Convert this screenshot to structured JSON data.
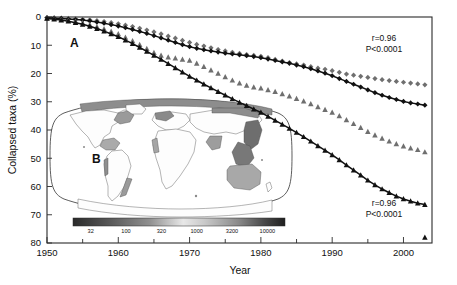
{
  "figure": {
    "panel_a_label": "A",
    "panel_b_label": "B"
  },
  "axes": {
    "xlabel": "Year",
    "ylabel": "Collapsed taxa (%)",
    "x_ticks": [
      "1950",
      "1960",
      "1970",
      "1980",
      "1990",
      "2000"
    ],
    "y_ticks": [
      "0",
      "10",
      "20",
      "30",
      "40",
      "50",
      "60",
      "70",
      "80"
    ]
  },
  "annotations": {
    "top": {
      "r": "r=0.96",
      "p": "P<0.0001"
    },
    "bottom": {
      "r": "r=0.96",
      "p": "P<0.0001"
    }
  },
  "colorbar": {
    "ticks": [
      "32",
      "100",
      "320",
      "1000",
      "3200",
      "10000"
    ]
  },
  "chart_data": {
    "type": "scatter",
    "title": "",
    "xlabel": "Year",
    "ylabel": "Collapsed taxa (%)",
    "xlim": [
      1950,
      2004
    ],
    "ylim": [
      80,
      0
    ],
    "y_inverted": true,
    "grid": false,
    "legend_position": "none",
    "x_ticks": [
      1950,
      1960,
      1970,
      1980,
      1990,
      2000
    ],
    "x_minor_ticks": [
      1955,
      1965,
      1975,
      1985,
      1995
    ],
    "y_ticks": [
      0,
      10,
      20,
      30,
      40,
      50,
      60,
      70,
      80
    ],
    "annotations": [
      {
        "text_r": "r=0.96",
        "text_p": "P<0.0001",
        "x": 1996,
        "y": 7
      },
      {
        "text_r": "r=0.96",
        "text_p": "P<0.0001",
        "x": 1996,
        "y": 64
      }
    ],
    "series": [
      {
        "name": "gray-diamonds",
        "marker": "diamond",
        "color": "#6f6f6f",
        "fit_line": false,
        "x": [
          1950,
          1951,
          1952,
          1953,
          1954,
          1955,
          1956,
          1957,
          1958,
          1959,
          1960,
          1961,
          1962,
          1963,
          1964,
          1965,
          1966,
          1967,
          1968,
          1969,
          1970,
          1971,
          1972,
          1973,
          1974,
          1975,
          1976,
          1977,
          1978,
          1979,
          1980,
          1981,
          1982,
          1983,
          1984,
          1985,
          1986,
          1987,
          1988,
          1989,
          1990,
          1991,
          1992,
          1993,
          1994,
          1995,
          1996,
          1997,
          1998,
          1999,
          2000,
          2001,
          2002,
          2003
        ],
        "y": [
          0.2,
          0.3,
          0.4,
          0.5,
          0.6,
          0.8,
          1.0,
          1.3,
          1.6,
          2.0,
          2.4,
          2.9,
          3.4,
          4.0,
          4.6,
          5.3,
          6.0,
          6.8,
          7.5,
          8.3,
          9.0,
          9.7,
          10.3,
          10.9,
          11.5,
          12.0,
          12.5,
          12.9,
          13.3,
          13.6,
          13.9,
          14.4,
          15.0,
          15.6,
          16.1,
          16.6,
          17.0,
          17.6,
          18.1,
          18.5,
          19.0,
          19.6,
          20.2,
          20.6,
          21.0,
          21.4,
          21.8,
          22.2,
          22.5,
          22.8,
          23.1,
          23.4,
          23.7,
          24.0
        ]
      },
      {
        "name": "black-diamonds",
        "marker": "diamond",
        "color": "#111111",
        "fit_line": true,
        "x": [
          1950,
          1951,
          1952,
          1953,
          1954,
          1955,
          1956,
          1957,
          1958,
          1959,
          1960,
          1961,
          1962,
          1963,
          1964,
          1965,
          1966,
          1967,
          1968,
          1969,
          1970,
          1971,
          1972,
          1973,
          1974,
          1975,
          1976,
          1977,
          1978,
          1979,
          1980,
          1981,
          1982,
          1983,
          1984,
          1985,
          1986,
          1987,
          1988,
          1989,
          1990,
          1991,
          1992,
          1993,
          1994,
          1995,
          1996,
          1997,
          1998,
          1999,
          2000,
          2001,
          2002,
          2003
        ],
        "y": [
          0.3,
          0.4,
          0.5,
          0.7,
          0.9,
          1.1,
          1.4,
          1.8,
          2.2,
          2.7,
          3.2,
          3.8,
          4.4,
          5.1,
          5.8,
          6.6,
          7.4,
          8.2,
          9.0,
          9.8,
          10.5,
          11.1,
          11.6,
          12.0,
          12.4,
          12.8,
          13.1,
          13.4,
          13.7,
          14.0,
          14.4,
          14.9,
          15.4,
          15.9,
          16.4,
          17.0,
          17.6,
          18.3,
          19.1,
          19.9,
          20.8,
          21.8,
          22.8,
          23.8,
          24.8,
          25.8,
          26.8,
          27.7,
          28.5,
          29.2,
          29.9,
          30.4,
          30.8,
          31.2
        ]
      },
      {
        "name": "gray-triangles",
        "marker": "triangle",
        "color": "#6f6f6f",
        "fit_line": false,
        "x": [
          1950,
          1951,
          1952,
          1953,
          1954,
          1955,
          1956,
          1957,
          1958,
          1959,
          1960,
          1961,
          1962,
          1963,
          1964,
          1965,
          1966,
          1967,
          1968,
          1969,
          1970,
          1971,
          1972,
          1973,
          1974,
          1975,
          1976,
          1977,
          1978,
          1979,
          1980,
          1981,
          1982,
          1983,
          1984,
          1985,
          1986,
          1987,
          1988,
          1989,
          1990,
          1991,
          1992,
          1993,
          1994,
          1995,
          1996,
          1997,
          1998,
          1999,
          2000,
          2001,
          2002,
          2003
        ],
        "y": [
          0.4,
          0.6,
          0.9,
          1.2,
          1.6,
          2.1,
          2.7,
          3.4,
          4.2,
          5.1,
          6.0,
          7.2,
          8.5,
          9.8,
          11.2,
          12.6,
          13.6,
          14.2,
          14.6,
          15.0,
          15.4,
          16.4,
          17.6,
          18.8,
          20.0,
          21.2,
          22.4,
          23.4,
          24.2,
          24.8,
          25.2,
          25.8,
          26.4,
          27.2,
          28.0,
          28.9,
          29.8,
          30.8,
          31.8,
          32.8,
          33.8,
          35.0,
          36.4,
          37.8,
          39.2,
          40.6,
          41.8,
          43.0,
          44.0,
          44.9,
          45.7,
          46.4,
          47.0,
          47.8
        ]
      },
      {
        "name": "black-triangles",
        "marker": "triangle",
        "color": "#111111",
        "fit_line": true,
        "x": [
          1950,
          1951,
          1952,
          1953,
          1954,
          1955,
          1956,
          1957,
          1958,
          1959,
          1960,
          1961,
          1962,
          1963,
          1964,
          1965,
          1966,
          1967,
          1968,
          1969,
          1970,
          1971,
          1972,
          1973,
          1974,
          1975,
          1976,
          1977,
          1978,
          1979,
          1980,
          1981,
          1982,
          1983,
          1984,
          1985,
          1986,
          1987,
          1988,
          1989,
          1990,
          1991,
          1992,
          1993,
          1994,
          1995,
          1996,
          1997,
          1998,
          1999,
          2000,
          2001,
          2002,
          2003
        ],
        "y": [
          0.5,
          0.8,
          1.1,
          1.5,
          2.0,
          2.6,
          3.3,
          4.1,
          5.0,
          6.0,
          7.0,
          8.2,
          9.4,
          10.8,
          12.2,
          13.6,
          15.0,
          16.5,
          18.0,
          19.5,
          21.0,
          22.4,
          23.8,
          25.1,
          26.4,
          27.7,
          29.0,
          30.2,
          31.4,
          32.6,
          33.8,
          35.2,
          36.6,
          38.0,
          39.4,
          40.9,
          42.4,
          44.0,
          45.6,
          47.2,
          48.8,
          50.6,
          52.4,
          54.2,
          56.0,
          57.8,
          59.4,
          60.9,
          62.2,
          63.4,
          64.4,
          65.2,
          65.9,
          66.4
        ],
        "outliers_x": [
          2003
        ],
        "outliers_y": [
          78.0
        ]
      }
    ]
  }
}
